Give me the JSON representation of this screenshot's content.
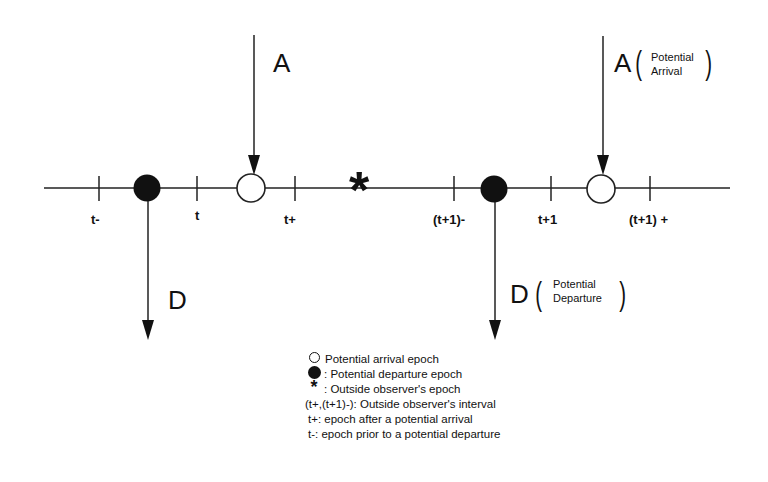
{
  "diagram": {
    "axis": {
      "ticks": [
        {
          "label": "t-",
          "x": 99
        },
        {
          "label": "t",
          "x": 197
        },
        {
          "label": "t+",
          "x": 295
        },
        {
          "label": "(t+1)-",
          "x": 454
        },
        {
          "label": "t+1",
          "x": 551
        },
        {
          "label": "(t+1) +",
          "x": 650
        }
      ]
    },
    "arrivals": [
      {
        "label": "A",
        "note": ""
      },
      {
        "label": "A",
        "note_line1": "Potential",
        "note_line2": "Arrival"
      }
    ],
    "departures": [
      {
        "label": "D",
        "note": ""
      },
      {
        "label": "D",
        "note_line1": "Potential",
        "note_line2": "Departure"
      }
    ],
    "observer_symbol": "*"
  },
  "legend": {
    "items": [
      {
        "symbol": "open-circle",
        "text": "Potential arrival epoch"
      },
      {
        "symbol": "filled-circle",
        "text": ": Potential departure epoch"
      },
      {
        "symbol": "star",
        "symbol_glyph": "*",
        "text": ": Outside observer's epoch"
      },
      {
        "symbol": "",
        "text": "(t+,(t+1)-): Outside observer's interval"
      },
      {
        "symbol": "",
        "text": "t+: epoch after a potential arrival"
      },
      {
        "symbol": "",
        "text": "t-: epoch prior to a potential departure"
      }
    ]
  }
}
